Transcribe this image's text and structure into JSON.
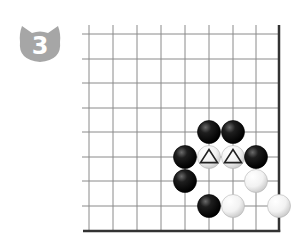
{
  "problem": {
    "number": "3",
    "badge_color": "#a6a6a6",
    "badge_shape": "cat-head-icon"
  },
  "board": {
    "x_lines": [
      89,
      113,
      137,
      161,
      185,
      209,
      233,
      256
    ],
    "y_lines": [
      34,
      59,
      83,
      108,
      132,
      157,
      181,
      206
    ],
    "edge_right_x": 279,
    "edge_bottom_y": 231,
    "top_y": 25,
    "left_x": 82,
    "line_color": "#8a8a8a",
    "edge_color": "#333333",
    "stone_radius": 11.5,
    "stones": [
      {
        "color": "black",
        "col": 5,
        "row": 4
      },
      {
        "color": "black",
        "col": 6,
        "row": 4
      },
      {
        "color": "black",
        "col": 4,
        "row": 5
      },
      {
        "color": "white",
        "col": 5,
        "row": 5,
        "mark": "triangle"
      },
      {
        "color": "white",
        "col": 6,
        "row": 5,
        "mark": "triangle"
      },
      {
        "color": "black",
        "col": 7,
        "row": 5
      },
      {
        "color": "black",
        "col": 4,
        "row": 6
      },
      {
        "color": "white",
        "col": 7,
        "row": 6
      },
      {
        "color": "black",
        "col": 5,
        "row": 7
      },
      {
        "color": "white",
        "col": 6,
        "row": 7
      },
      {
        "color": "white",
        "col": 8,
        "row": 7
      }
    ]
  }
}
